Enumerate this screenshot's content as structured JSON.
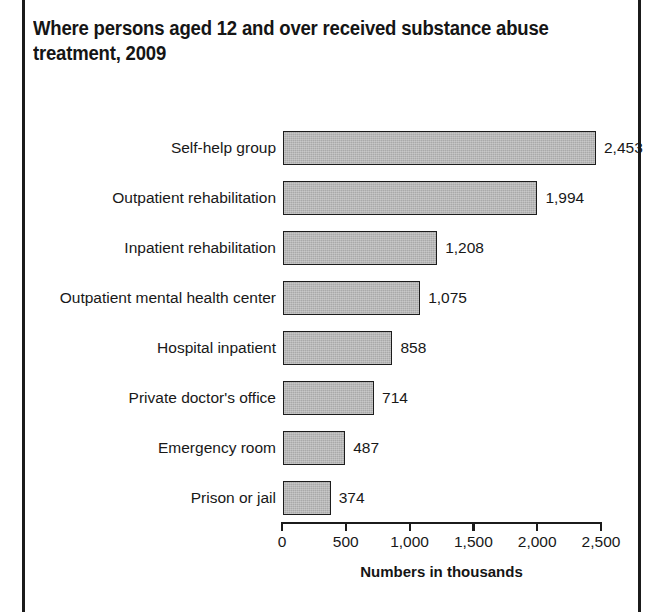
{
  "chart_data": {
    "type": "bar",
    "orientation": "horizontal",
    "title": "Where persons aged 12 and over received substance abuse treatment, 2009",
    "xlabel": "Numbers in thousands",
    "ylabel": "",
    "xlim": [
      0,
      2500
    ],
    "grid": false,
    "legend": "none",
    "bar_color": "#a9a9a9",
    "bar_border_color": "#1d1d1d",
    "categories": [
      "Self-help group",
      "Outpatient rehabilitation",
      "Inpatient rehabilitation",
      "Outpatient mental health center",
      "Hospital inpatient",
      "Private doctor's office",
      "Emergency room",
      "Prison or jail"
    ],
    "values": [
      2453,
      1994,
      1208,
      1075,
      858,
      714,
      487,
      374
    ],
    "value_labels": [
      "2,453",
      "1,994",
      "1,208",
      "1,075",
      "858",
      "714",
      "487",
      "374"
    ],
    "xticks": [
      0,
      500,
      1000,
      1500,
      2000,
      2500
    ],
    "xtick_labels": [
      "0",
      "500",
      "1,000",
      "1,500",
      "2,000",
      "2,500"
    ]
  }
}
